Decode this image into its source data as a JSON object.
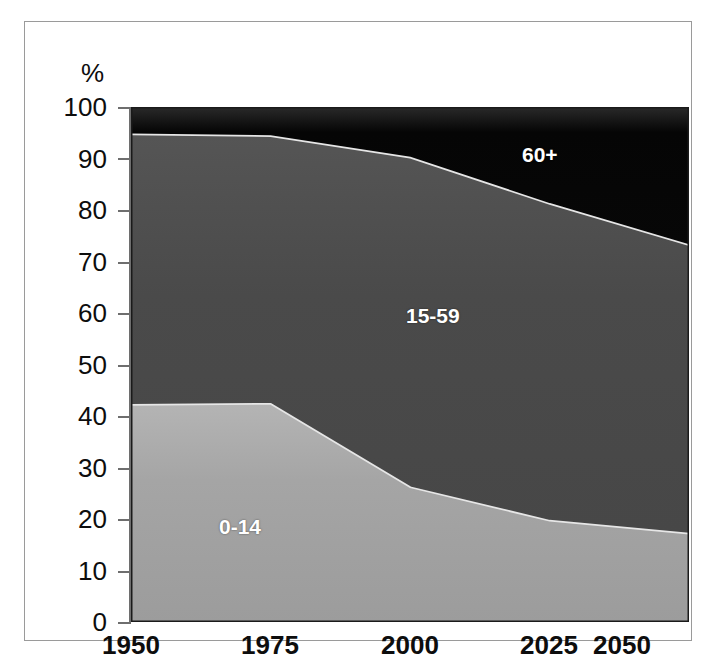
{
  "chart_data": {
    "type": "area",
    "stacked": true,
    "normalized": true,
    "title": "",
    "subtitle": "",
    "xlabel": "",
    "ylabel": "%",
    "unit_label": "%",
    "x": [
      1950,
      1975,
      2000,
      2025,
      2050
    ],
    "categories": [
      "1950",
      "1975",
      "2000",
      "2025",
      "2050"
    ],
    "xtick_labels": [
      "1950",
      "1975",
      "2000",
      "2025",
      "2050"
    ],
    "ytick_labels": [
      "0",
      "10",
      "20",
      "30",
      "40",
      "50",
      "60",
      "70",
      "80",
      "90",
      "100"
    ],
    "ytick_values": [
      0,
      10,
      20,
      30,
      40,
      50,
      60,
      70,
      80,
      90,
      100
    ],
    "ylim": [
      0,
      100
    ],
    "xlim": [
      1950,
      2050
    ],
    "grid": false,
    "legend": "inline-band-labels",
    "series": [
      {
        "name": "0-14",
        "label": "0-14",
        "color": "#a3a3a3",
        "values": [
          42.0,
          42.2,
          26.0,
          19.5,
          17.0
        ]
      },
      {
        "name": "15-59",
        "label": "15-59",
        "color": "#4b4b4b",
        "values": [
          52.5,
          52.0,
          64.0,
          61.5,
          56.0
        ]
      },
      {
        "name": "60+",
        "label": "60+",
        "color": "#070707",
        "values": [
          5.5,
          5.8,
          10.0,
          19.0,
          27.0
        ]
      }
    ],
    "cumulative_upper_bounds": {
      "0-14": [
        42.0,
        42.2,
        26.0,
        19.5,
        17.0
      ],
      "15-59": [
        94.5,
        94.2,
        90.0,
        81.0,
        73.0
      ],
      "60+": [
        100,
        100,
        100,
        100,
        100
      ]
    },
    "annotations": [
      {
        "text": "60+",
        "series": "60+",
        "x": 2037,
        "y": 92
      },
      {
        "text": "15-59",
        "series": "15-59",
        "x": 2000,
        "y": 57
      },
      {
        "text": "0-14",
        "series": "0-14",
        "x": 1966,
        "y": 21
      }
    ],
    "colors": {
      "age_0_14": "#a3a3a3",
      "age_15_59": "#4b4b4b",
      "age_60_plus": "#070707",
      "band_highlight": "#e8e8e8",
      "axis": "#6e6e6e",
      "frame": "#9a9a9a",
      "text": "#0d0d0d",
      "label_text": "#ffffff",
      "background": "#ffffff"
    }
  }
}
